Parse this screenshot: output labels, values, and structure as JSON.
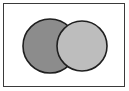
{
  "figure": {
    "kind": "venn-diagram",
    "width": 129,
    "height": 91,
    "background_color": "#ffffff",
    "frame": {
      "visible": true,
      "color": "#3a3a3a",
      "thickness": 1,
      "x": 3,
      "y": 3,
      "width": 122,
      "height": 84,
      "fill": "#ffffff"
    }
  },
  "chart_data": {
    "type": "venn",
    "title": "",
    "subtitle": "",
    "xlabel": "",
    "ylabel": "",
    "legend": [],
    "annotations": [],
    "labels_visible": false,
    "set_count": 2,
    "overlap_style": "right-circle-drawn-over-left",
    "sets": [
      {
        "name": "left-set",
        "fill": "#8c8c8c",
        "stroke": "#1f1f1f",
        "stroke_width": 1.6,
        "cx": 50,
        "cy": 46,
        "r": 27,
        "label": ""
      },
      {
        "name": "right-set",
        "fill": "#bdbdbd",
        "stroke": "#1f1f1f",
        "stroke_width": 1.6,
        "cx": 82,
        "cy": 46,
        "r": 25,
        "label": ""
      }
    ],
    "regions": [
      {
        "name": "left-only",
        "fill": "#8c8c8c"
      },
      {
        "name": "intersection",
        "fill": "#bdbdbd"
      },
      {
        "name": "right-only",
        "fill": "#bdbdbd"
      }
    ]
  }
}
